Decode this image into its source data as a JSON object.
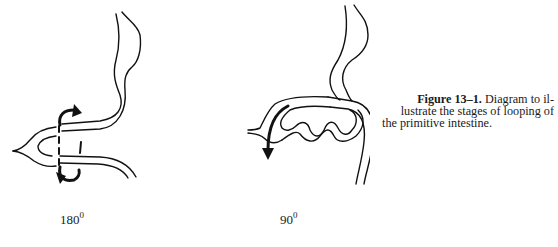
{
  "figure": {
    "number_label": "Figure 13–1.",
    "caption_lines": [
      "Diagram to il-",
      "lustrate the stages of looping of",
      "the primitive intestine."
    ]
  },
  "panels": [
    {
      "id": "stage-180",
      "rotation_label": "180",
      "unit": "0"
    },
    {
      "id": "stage-90",
      "rotation_label": "90",
      "unit": "0"
    }
  ]
}
